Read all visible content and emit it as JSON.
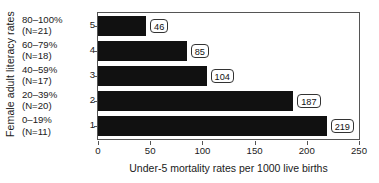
{
  "chart_data": {
    "type": "bar",
    "orientation": "horizontal",
    "title": "",
    "xlabel": "Under-5 mortality rates per 1000 live births",
    "ylabel": "Female adult literacy rates",
    "xlim": [
      0,
      250
    ],
    "xticks": [
      0,
      50,
      100,
      150,
      200,
      250
    ],
    "xtick_labels": [
      "0",
      "50",
      "100",
      "150",
      "200",
      "250"
    ],
    "grid": false,
    "legend": null,
    "categories": [
      "1",
      "2",
      "3",
      "4",
      "5"
    ],
    "category_labels": [
      "0–19%",
      "20–39%",
      "40–59%",
      "60–79%",
      "80–100%"
    ],
    "category_counts": [
      "(N=11)",
      "(N=20)",
      "(N=17)",
      "(N=18)",
      "(N=21)"
    ],
    "values": [
      219,
      187,
      104,
      85,
      46
    ],
    "value_labels": [
      "219",
      "187",
      "104",
      "85",
      "46"
    ],
    "bar_color": "#111111",
    "frame_color": "#555555",
    "text_color": "#1a1a1a",
    "background": "#ffffff"
  }
}
